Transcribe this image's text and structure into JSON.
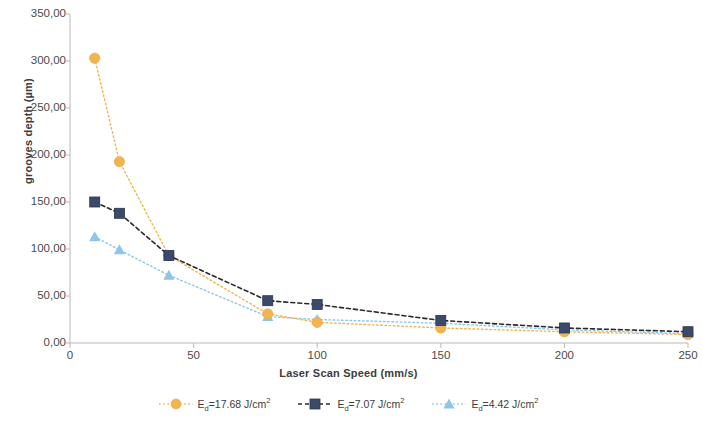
{
  "chart_data": {
    "type": "line",
    "title": "",
    "xlabel": "Laser Scan Speed (mm/s)",
    "ylabel": "grooves depth (µm)",
    "xlim": [
      0,
      250
    ],
    "ylim": [
      0,
      350
    ],
    "xticks": [
      "0",
      "50",
      "100",
      "150",
      "200",
      "250"
    ],
    "xtick_values": [
      0,
      50,
      100,
      150,
      200,
      250
    ],
    "yticks": [
      "0,00",
      "50,00",
      "100,00",
      "150,00",
      "200,00",
      "250,00",
      "300,00",
      "350,00"
    ],
    "ytick_values": [
      0,
      50,
      100,
      150,
      200,
      250,
      300,
      350
    ],
    "grid": false,
    "legend_position": "bottom",
    "x": [
      10,
      20,
      40,
      80,
      100,
      150,
      200,
      250
    ],
    "series": [
      {
        "name": "Eₐ=17.68 J/cm²",
        "label_prefix": "E",
        "label_sub": "d",
        "label_rest": "=17.68 J/cm",
        "label_sup": "2",
        "color": "#F2B451",
        "marker": "circle",
        "values": [
          303,
          193,
          93,
          31,
          22,
          16,
          12,
          9
        ]
      },
      {
        "name": "Eₐ=7.07 J/cm²",
        "label_prefix": "E",
        "label_sub": "d",
        "label_rest": "=7.07 J/cm",
        "label_sup": "2",
        "color": "#3B4A6B",
        "marker": "square",
        "values": [
          150,
          138,
          93,
          45,
          41,
          24,
          16,
          12
        ]
      },
      {
        "name": "Eₐ=4.42 J/cm²",
        "label_prefix": "E",
        "label_sub": "d",
        "label_rest": "=4.42 J/cm",
        "label_sup": "2",
        "color": "#8EC5EC",
        "marker": "triangle",
        "values": [
          113,
          99,
          72,
          28,
          25,
          21,
          14,
          10
        ]
      }
    ]
  },
  "axis": {
    "y_title": "grooves depth (µm)",
    "x_title": "Laser Scan Speed (mm/s)"
  }
}
